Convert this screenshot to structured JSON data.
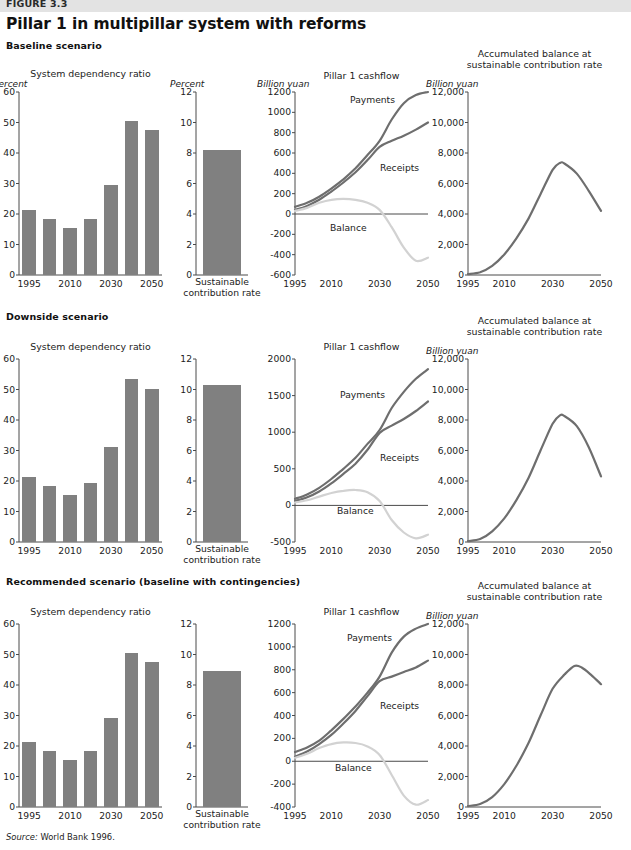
{
  "figure": {
    "number": "FIGURE 3.3",
    "title": "Pillar 1 in multipillar system with reforms",
    "source": "Source: World Bank 1996."
  },
  "colors": {
    "bar": "#808080",
    "line_dark": "#6e6e6e",
    "line_light": "#d2d2d2",
    "axis": "#4a4a4a",
    "band": "#e3e3e3"
  },
  "scenarios": [
    {
      "id": "baseline",
      "label": "Baseline scenario"
    },
    {
      "id": "downside",
      "label": "Downside scenario"
    },
    {
      "id": "recommended",
      "label": "Recommended scenario (baseline with contingencies)"
    }
  ],
  "labels": {
    "dependency_title": "System dependency ratio",
    "contribution_title_line1": "Sustainable",
    "contribution_title_line2": "contribution rate",
    "cashflow_title": "Pillar 1 cashflow",
    "accum_title_line1": "Accumulated balance at",
    "accum_title_line2": "sustainable contribution rate",
    "unit_percent": "Percent",
    "unit_billion": "Billion yuan",
    "series_payments": "Payments",
    "series_receipts": "Receipts",
    "series_balance": "Balance"
  },
  "chart_data": [
    {
      "id": "dep-baseline",
      "type": "bar",
      "title": "System dependency ratio",
      "scenario": "Baseline scenario",
      "ylabel": "Percent",
      "ylim": [
        0,
        60
      ],
      "yticks": [
        0,
        10,
        20,
        30,
        40,
        50,
        60
      ],
      "yticklabels": [
        "0",
        "10",
        "20",
        "30",
        "40",
        "50",
        "60"
      ],
      "x": [
        1995,
        2000,
        2010,
        2020,
        2030,
        2040,
        2050
      ],
      "xticklabels": [
        "1995",
        "2010",
        "2030",
        "2050"
      ],
      "xtickvalues": [
        1995,
        2010,
        2030,
        2050
      ],
      "categories": [
        "1995",
        "2000",
        "2010",
        "2020",
        "2030",
        "2040",
        "2050"
      ],
      "values": [
        21.2,
        18.2,
        15.3,
        18.3,
        29.5,
        50.4,
        47.4
      ],
      "grid": false
    },
    {
      "id": "scr-baseline",
      "type": "bar",
      "title": "Sustainable contribution rate",
      "scenario": "Baseline scenario",
      "ylabel": "Percent",
      "ylim": [
        0,
        12
      ],
      "yticks": [
        0,
        2,
        4,
        6,
        8,
        10,
        12
      ],
      "yticklabels": [
        "0",
        "2",
        "4",
        "6",
        "8",
        "10",
        "12"
      ],
      "categories": [
        "Sustainable contribution rate"
      ],
      "values": [
        8.2
      ],
      "grid": false
    },
    {
      "id": "cash-baseline",
      "type": "line",
      "title": "Pillar 1 cashflow",
      "scenario": "Baseline scenario",
      "ylabel": "Billion yuan",
      "ylim": [
        -600,
        1200
      ],
      "yticks": [
        -600,
        -400,
        -200,
        0,
        200,
        400,
        600,
        800,
        1000,
        1200
      ],
      "yticklabels": [
        "-600",
        "-400",
        "-200",
        "0",
        "200",
        "400",
        "600",
        "800",
        "1000",
        "1200"
      ],
      "xlim": [
        1995,
        2050
      ],
      "xtickvalues": [
        1995,
        2010,
        2030,
        2050
      ],
      "xticklabels": [
        "1995",
        "2010",
        "2030",
        "2050"
      ],
      "x": [
        1995,
        2000,
        2005,
        2010,
        2015,
        2020,
        2025,
        2030,
        2035,
        2040,
        2045,
        2050
      ],
      "series": [
        {
          "name": "Payments",
          "color": "#6e6e6e",
          "values": [
            70,
            110,
            170,
            250,
            340,
            450,
            580,
            720,
            930,
            1090,
            1170,
            1200
          ]
        },
        {
          "name": "Receipts",
          "color": "#6e6e6e",
          "values": [
            40,
            80,
            140,
            220,
            310,
            410,
            530,
            660,
            720,
            770,
            830,
            900
          ]
        },
        {
          "name": "Balance",
          "color": "#d2d2d2",
          "values": [
            30,
            60,
            110,
            140,
            150,
            140,
            110,
            40,
            -130,
            -330,
            -460,
            -430
          ]
        }
      ],
      "grid": false
    },
    {
      "id": "accum-baseline",
      "type": "line",
      "title": "Accumulated balance at sustainable contribution rate",
      "scenario": "Baseline scenario",
      "ylabel": "Billion yuan",
      "ylim": [
        0,
        12000
      ],
      "yticks": [
        0,
        2000,
        4000,
        6000,
        8000,
        10000,
        12000
      ],
      "yticklabels": [
        "0",
        "2,000",
        "4,000",
        "6,000",
        "8,000",
        "10,000",
        "12,000"
      ],
      "xlim": [
        1995,
        2050
      ],
      "xtickvalues": [
        1995,
        2010,
        2030,
        2050
      ],
      "xticklabels": [
        "1995",
        "2010",
        "2030",
        "2050"
      ],
      "x": [
        1995,
        2000,
        2005,
        2010,
        2015,
        2020,
        2025,
        2030,
        2033,
        2035,
        2040,
        2045,
        2050
      ],
      "series": [
        {
          "name": "Accumulated balance",
          "color": "#6e6e6e",
          "values": [
            60,
            180,
            600,
            1350,
            2400,
            3700,
            5300,
            6900,
            7350,
            7300,
            6650,
            5500,
            4200
          ]
        }
      ],
      "grid": false
    },
    {
      "id": "dep-downside",
      "type": "bar",
      "title": "System dependency ratio",
      "scenario": "Downside scenario",
      "ylabel": "Percent",
      "ylim": [
        0,
        60
      ],
      "yticks": [
        0,
        10,
        20,
        30,
        40,
        50,
        60
      ],
      "yticklabels": [
        "0",
        "10",
        "20",
        "30",
        "40",
        "50",
        "60"
      ],
      "categories": [
        "1995",
        "2000",
        "2010",
        "2020",
        "2030",
        "2040",
        "2050"
      ],
      "xtickvalues": [
        1995,
        2010,
        2030,
        2050
      ],
      "xticklabels": [
        "1995",
        "2010",
        "2030",
        "2050"
      ],
      "values": [
        21.3,
        18.3,
        15.4,
        19.4,
        31.3,
        53.3,
        50.3
      ],
      "grid": false
    },
    {
      "id": "scr-downside",
      "type": "bar",
      "title": "Sustainable contribution rate",
      "scenario": "Downside scenario",
      "ylabel": "Percent",
      "ylim": [
        0,
        12
      ],
      "yticks": [
        0,
        2,
        4,
        6,
        8,
        10,
        12
      ],
      "yticklabels": [
        "0",
        "2",
        "4",
        "6",
        "8",
        "10",
        "12"
      ],
      "categories": [
        "Sustainable contribution rate"
      ],
      "values": [
        10.3
      ],
      "grid": false
    },
    {
      "id": "cash-downside",
      "type": "line",
      "title": "Pillar 1 cashflow",
      "scenario": "Downside scenario",
      "ylabel": "Billion yuan",
      "ylim": [
        -500,
        2000
      ],
      "yticks": [
        -500,
        0,
        500,
        1000,
        1500,
        2000
      ],
      "yticklabels": [
        "-500",
        "0",
        "500",
        "1000",
        "1500",
        "2000"
      ],
      "xlim": [
        1995,
        2050
      ],
      "xtickvalues": [
        1995,
        2010,
        2030,
        2050
      ],
      "xticklabels": [
        "1995",
        "2010",
        "2030",
        "2050"
      ],
      "x": [
        1995,
        2000,
        2005,
        2010,
        2015,
        2020,
        2025,
        2030,
        2035,
        2040,
        2045,
        2050
      ],
      "series": [
        {
          "name": "Payments",
          "color": "#6e6e6e",
          "values": [
            90,
            150,
            240,
            360,
            500,
            650,
            840,
            1030,
            1330,
            1550,
            1730,
            1860
          ]
        },
        {
          "name": "Receipts",
          "color": "#6e6e6e",
          "values": [
            60,
            110,
            190,
            300,
            430,
            570,
            760,
            990,
            1090,
            1180,
            1290,
            1420
          ]
        },
        {
          "name": "Balance",
          "color": "#d2d2d2",
          "values": [
            40,
            70,
            120,
            170,
            200,
            210,
            180,
            60,
            -200,
            -370,
            -450,
            -400
          ]
        }
      ],
      "grid": false
    },
    {
      "id": "accum-downside",
      "type": "line",
      "title": "Accumulated balance at sustainable contribution rate",
      "scenario": "Downside scenario",
      "ylabel": "Billion yuan",
      "ylim": [
        0,
        12000
      ],
      "yticks": [
        0,
        2000,
        4000,
        6000,
        8000,
        10000,
        12000
      ],
      "yticklabels": [
        "0",
        "2,000",
        "4,000",
        "6,000",
        "8,000",
        "10,000",
        "12,000"
      ],
      "xlim": [
        1995,
        2050
      ],
      "xtickvalues": [
        1995,
        2010,
        2030,
        2050
      ],
      "xticklabels": [
        "1995",
        "2010",
        "2030",
        "2050"
      ],
      "x": [
        1995,
        2000,
        2005,
        2010,
        2015,
        2020,
        2025,
        2030,
        2033,
        2035,
        2040,
        2045,
        2050
      ],
      "series": [
        {
          "name": "Accumulated balance",
          "color": "#6e6e6e",
          "values": [
            60,
            200,
            700,
            1550,
            2750,
            4200,
            6000,
            7750,
            8300,
            8250,
            7600,
            6200,
            4300
          ]
        }
      ],
      "grid": false
    },
    {
      "id": "dep-recommended",
      "type": "bar",
      "title": "System dependency ratio",
      "scenario": "Recommended scenario (baseline with contingencies)",
      "ylabel": "Percent",
      "ylim": [
        0,
        60
      ],
      "yticks": [
        0,
        10,
        20,
        30,
        40,
        50,
        60
      ],
      "yticklabels": [
        "0",
        "10",
        "20",
        "30",
        "40",
        "50",
        "60"
      ],
      "categories": [
        "1995",
        "2000",
        "2010",
        "2020",
        "2030",
        "2040",
        "2050"
      ],
      "xtickvalues": [
        1995,
        2010,
        2030,
        2050
      ],
      "xticklabels": [
        "1995",
        "2010",
        "2030",
        "2050"
      ],
      "values": [
        21.2,
        18.2,
        15.3,
        18.3,
        29.3,
        50.4,
        47.4
      ],
      "grid": false
    },
    {
      "id": "scr-recommended",
      "type": "bar",
      "title": "Sustainable contribution rate",
      "scenario": "Recommended scenario (baseline with contingencies)",
      "ylabel": "Percent",
      "ylim": [
        0,
        12
      ],
      "yticks": [
        0,
        2,
        4,
        6,
        8,
        10,
        12
      ],
      "yticklabels": [
        "0",
        "2",
        "4",
        "6",
        "8",
        "10",
        "12"
      ],
      "categories": [
        "Sustainable contribution rate"
      ],
      "values": [
        8.95
      ],
      "grid": false
    },
    {
      "id": "cash-recommended",
      "type": "line",
      "title": "Pillar 1 cashflow",
      "scenario": "Recommended scenario (baseline with contingencies)",
      "ylabel": "Billion yuan",
      "ylim": [
        -400,
        1200
      ],
      "yticks": [
        -400,
        -200,
        0,
        200,
        400,
        600,
        800,
        1000,
        1200
      ],
      "yticklabels": [
        "-400",
        "-200",
        "0",
        "200",
        "400",
        "600",
        "800",
        "1000",
        "1200"
      ],
      "xlim": [
        1995,
        2050
      ],
      "xtickvalues": [
        1995,
        2010,
        2030,
        2050
      ],
      "xticklabels": [
        "1995",
        "2010",
        "2030",
        "2050"
      ],
      "x": [
        1995,
        2000,
        2005,
        2010,
        2015,
        2020,
        2025,
        2030,
        2035,
        2040,
        2045,
        2050
      ],
      "series": [
        {
          "name": "Payments",
          "color": "#6e6e6e",
          "values": [
            80,
            120,
            180,
            270,
            370,
            480,
            600,
            740,
            950,
            1090,
            1160,
            1200
          ]
        },
        {
          "name": "Receipts",
          "color": "#6e6e6e",
          "values": [
            40,
            85,
            150,
            230,
            330,
            440,
            570,
            700,
            740,
            780,
            820,
            880
          ]
        },
        {
          "name": "Balance",
          "color": "#d2d2d2",
          "values": [
            30,
            65,
            115,
            150,
            165,
            160,
            130,
            55,
            -120,
            -300,
            -380,
            -340
          ]
        }
      ],
      "grid": false
    },
    {
      "id": "accum-recommended",
      "type": "line",
      "title": "Accumulated balance at sustainable contribution rate",
      "scenario": "Recommended scenario (baseline with contingencies)",
      "ylabel": "Billion yuan",
      "ylim": [
        0,
        12000
      ],
      "yticks": [
        0,
        2000,
        4000,
        6000,
        8000,
        10000,
        12000
      ],
      "yticklabels": [
        "0",
        "2,000",
        "4,000",
        "6,000",
        "8,000",
        "10,000",
        "12,000"
      ],
      "xlim": [
        1995,
        2050
      ],
      "xtickvalues": [
        1995,
        2010,
        2030,
        2050
      ],
      "xticklabels": [
        "1995",
        "2010",
        "2030",
        "2050"
      ],
      "x": [
        1995,
        2000,
        2005,
        2010,
        2015,
        2020,
        2025,
        2030,
        2035,
        2039,
        2042,
        2046,
        2050
      ],
      "series": [
        {
          "name": "Accumulated balance",
          "color": "#6e6e6e",
          "values": [
            60,
            200,
            650,
            1500,
            2700,
            4200,
            6000,
            7750,
            8700,
            9250,
            9150,
            8650,
            8050
          ]
        }
      ],
      "grid": false
    }
  ]
}
